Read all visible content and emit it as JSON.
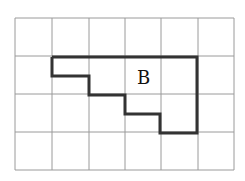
{
  "figure": {
    "grid": {
      "columns": 6,
      "rows": 4,
      "vertical_x": [
        15,
        52,
        89,
        125,
        161,
        198,
        234
      ],
      "horizontal_y": [
        18,
        56,
        94,
        132,
        170
      ],
      "line_color": "#9a9a9a"
    },
    "shape": {
      "label": "B",
      "outline_color": "#333333",
      "points": "52,57 197,57 197,133 160,133 160,114 125,114 125,95 89,95 89,76 52,76 52,57"
    }
  }
}
